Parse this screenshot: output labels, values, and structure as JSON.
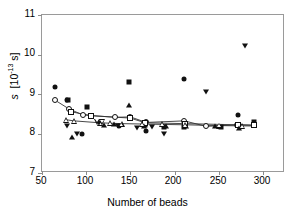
{
  "chart_data": {
    "type": "scatter",
    "title": "",
    "xlabel": "Number of beads",
    "ylabel": "s  [10-13 s]",
    "ylabel_parts": {
      "symbol": "s",
      "units_pre": "[10",
      "units_exp": "-13",
      "units_post": " s]"
    },
    "xlim": [
      50,
      325
    ],
    "ylim": [
      7,
      11
    ],
    "xticks": [
      50,
      100,
      150,
      200,
      250,
      300
    ],
    "yticks": [
      7,
      8,
      9,
      10,
      11
    ],
    "grid": false,
    "legend": "none",
    "series": [
      {
        "name": "filled-circle",
        "marker": "circle-filled",
        "points": [
          [
            65,
            9.17
          ],
          [
            78,
            8.86
          ],
          [
            95,
            8.0
          ],
          [
            137,
            8.19
          ],
          [
            168,
            8.06
          ],
          [
            211,
            9.38
          ],
          [
            272,
            8.46
          ]
        ]
      },
      {
        "name": "open-circle",
        "marker": "circle-open",
        "trendline": true,
        "points": [
          [
            65,
            8.84
          ],
          [
            80,
            8.63
          ],
          [
            96,
            8.47
          ],
          [
            133,
            8.41
          ],
          [
            150,
            8.42
          ],
          [
            168,
            8.28
          ],
          [
            211,
            8.32
          ],
          [
            236,
            8.18
          ],
          [
            271,
            8.22
          ],
          [
            290,
            8.21
          ]
        ]
      },
      {
        "name": "filled-square",
        "marker": "square-filled",
        "points": [
          [
            79,
            8.85
          ],
          [
            101,
            8.67
          ],
          [
            149,
            9.3
          ],
          [
            166,
            8.21
          ],
          [
            188,
            8.17
          ],
          [
            211,
            8.17
          ],
          [
            253,
            8.17
          ],
          [
            290,
            8.3
          ]
        ]
      },
      {
        "name": "open-square",
        "marker": "square-open",
        "trendline": true,
        "points": [
          [
            83,
            8.55
          ],
          [
            106,
            8.45
          ],
          [
            150,
            8.39
          ],
          [
            167,
            8.27
          ],
          [
            212,
            8.25
          ],
          [
            272,
            8.22
          ],
          [
            290,
            8.21
          ]
        ]
      },
      {
        "name": "filled-triangle-up",
        "marker": "tri-up-filled",
        "points": [
          [
            84,
            7.92
          ],
          [
            120,
            8.22
          ],
          [
            131,
            8.23
          ],
          [
            149,
            8.72
          ],
          [
            165,
            8.2
          ],
          [
            190,
            8.19
          ],
          [
            213,
            8.2
          ],
          [
            246,
            8.18
          ],
          [
            273,
            8.13
          ]
        ]
      },
      {
        "name": "open-triangle-up",
        "marker": "tri-up-open",
        "trendline": true,
        "points": [
          [
            77,
            8.35
          ],
          [
            86,
            8.32
          ],
          [
            116,
            8.27
          ],
          [
            127,
            8.26
          ],
          [
            140,
            8.25
          ],
          [
            163,
            8.24
          ],
          [
            186,
            8.23
          ],
          [
            212,
            8.22
          ],
          [
            250,
            8.2
          ],
          [
            276,
            8.19
          ]
        ]
      },
      {
        "name": "filled-triangle-down",
        "marker": "tri-down-filled",
        "points": [
          [
            78,
            8.18
          ],
          [
            90,
            8.0
          ],
          [
            115,
            8.27
          ],
          [
            136,
            8.2
          ],
          [
            158,
            8.14
          ],
          [
            174,
            8.17
          ],
          [
            188,
            7.98
          ],
          [
            236,
            9.06
          ],
          [
            280,
            10.22
          ]
        ]
      },
      {
        "name": "open-triangle-down",
        "marker": "tri-down-open",
        "points": [
          [
            112,
            8.3
          ],
          [
            118,
            8.29
          ]
        ]
      }
    ],
    "trendlines": [
      {
        "name": "upper-curve",
        "points": [
          [
            65,
            8.84
          ],
          [
            80,
            8.63
          ],
          [
            96,
            8.47
          ],
          [
            133,
            8.41
          ],
          [
            150,
            8.42
          ],
          [
            168,
            8.28
          ],
          [
            211,
            8.32
          ],
          [
            236,
            8.18
          ],
          [
            271,
            8.22
          ],
          [
            290,
            8.21
          ]
        ]
      },
      {
        "name": "middle-curve",
        "points": [
          [
            83,
            8.55
          ],
          [
            106,
            8.45
          ],
          [
            150,
            8.39
          ],
          [
            167,
            8.27
          ],
          [
            212,
            8.25
          ],
          [
            272,
            8.22
          ],
          [
            290,
            8.21
          ]
        ]
      },
      {
        "name": "lower-curve",
        "points": [
          [
            77,
            8.35
          ],
          [
            86,
            8.32
          ],
          [
            116,
            8.27
          ],
          [
            140,
            8.25
          ],
          [
            163,
            8.24
          ],
          [
            186,
            8.23
          ],
          [
            212,
            8.22
          ],
          [
            250,
            8.2
          ],
          [
            290,
            8.19
          ]
        ]
      }
    ]
  },
  "axis": {
    "x_title": "Number of beads",
    "y_symbol": "s",
    "y_unit_open": "[10",
    "y_unit_exp": "-13",
    "y_unit_close": " s]",
    "xtick_labels": [
      "50",
      "100",
      "150",
      "200",
      "250",
      "300"
    ],
    "ytick_labels": [
      "7",
      "8",
      "9",
      "10",
      "11"
    ]
  },
  "colors": {
    "marker": "#111111",
    "line": "#333333",
    "axis": "#9a9a9a",
    "background": "#ffffff"
  }
}
